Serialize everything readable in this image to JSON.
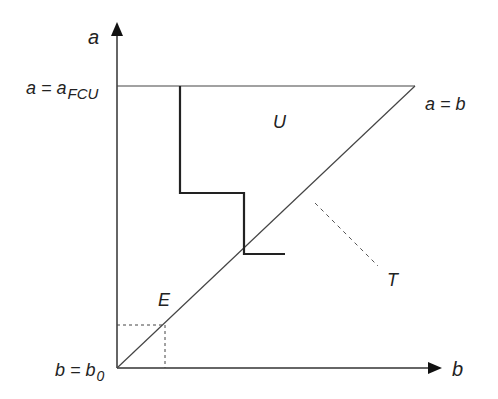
{
  "diagram": {
    "axes": {
      "y_label": "a",
      "x_label": "b"
    },
    "labels": {
      "top_line": "a = a",
      "top_line_sub": "FCU",
      "origin": "b = b",
      "origin_sub": "0",
      "diagonal": "a = b",
      "region_upper": "U",
      "region_lower": "E",
      "tangent_label": "T"
    },
    "colors": {
      "line": "#333333",
      "text": "#222222",
      "background": "#ffffff"
    }
  }
}
